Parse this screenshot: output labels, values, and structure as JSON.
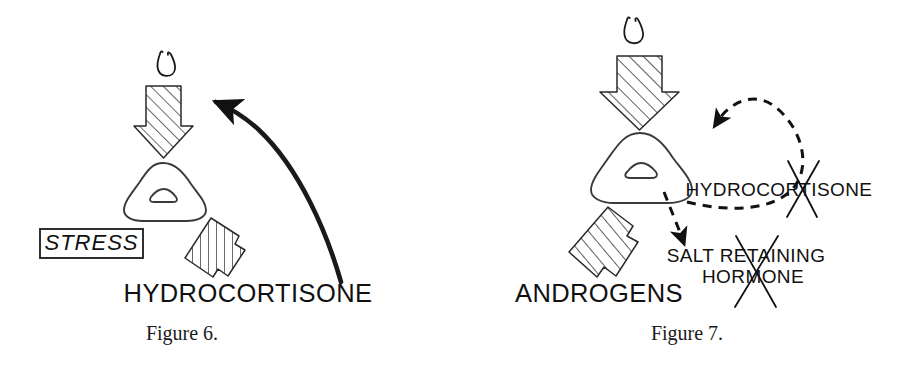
{
  "document": {
    "title": "Adrenal feedback diagrams",
    "background_color": "#ffffff",
    "ink_color": "#111111"
  },
  "figures": [
    {
      "id": "figure-6",
      "caption": "Figure 6.",
      "labels": {
        "stress": "STRESS",
        "hydrocortisone": "HYDROCORTISONE"
      },
      "icons": {
        "pituitary": "pituitary-gland-icon",
        "adrenal": "adrenal-gland-icon",
        "acth_arrow": "hatched-down-arrow-icon",
        "output_arrow": "hatched-down-left-arrow-icon",
        "feedback_arrow": "solid-curved-feedback-arrow-icon",
        "inhibition": "inhibition-bar-icon"
      },
      "annotations": {
        "feedback_type": "solid",
        "feedback_blocked": true,
        "crossed_out": []
      }
    },
    {
      "id": "figure-7",
      "caption": "Figure 7.",
      "labels": {
        "hydrocortisone": "HYDROCORTISONE",
        "salt_retaining_hormone_line1": "SALT RETAINING",
        "salt_retaining_hormone_line2": "HORMONE",
        "androgens": "ANDROGENS"
      },
      "icons": {
        "pituitary": "pituitary-gland-icon",
        "adrenal": "adrenal-gland-icon",
        "acth_arrow": "hatched-down-arrow-icon",
        "androgens_arrow": "hatched-down-left-arrow-icon",
        "feedback_arrow": "dashed-curved-feedback-arrow-icon",
        "salt_arrow": "dashed-short-arrow-icon",
        "cross_hydrocortisone": "x-cross-icon",
        "cross_salt_hormone": "x-cross-icon"
      },
      "annotations": {
        "feedback_type": "dashed",
        "feedback_blocked": false,
        "crossed_out": [
          "HYDROCORTISONE",
          "SALT RETAINING HORMONE"
        ]
      }
    }
  ]
}
